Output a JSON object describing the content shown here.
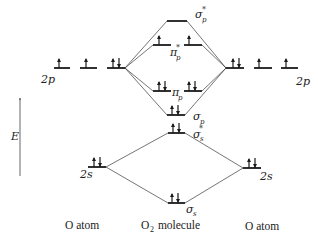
{
  "diagram": {
    "axis": {
      "label": "E"
    },
    "columns": {
      "left": "O atom",
      "center_main": "O",
      "center_sub": "2",
      "center_rest": " molecule",
      "right": "O atom"
    },
    "atomic_orbitals": {
      "left_2p": {
        "label": "2p",
        "electrons": [
          1,
          1,
          2
        ]
      },
      "right_2p": {
        "label": "2p",
        "electrons": [
          2,
          1,
          1
        ]
      },
      "left_2s": {
        "label": "2s",
        "electrons": 2
      },
      "right_2s": {
        "label": "2s",
        "electrons": 2
      }
    },
    "molecular_orbitals": [
      {
        "name": "σ",
        "sub": "p",
        "star": "*",
        "electrons": 0
      },
      {
        "name": "π",
        "sub": "p",
        "star": "*",
        "electrons": [
          1,
          1
        ]
      },
      {
        "name": "π",
        "sub": "p",
        "star": "",
        "electrons": [
          2,
          2
        ]
      },
      {
        "name": "σ",
        "sub": "p",
        "star": "",
        "electrons": 2
      },
      {
        "name": "σ",
        "sub": "s",
        "star": "*",
        "electrons": 2
      },
      {
        "name": "σ",
        "sub": "s",
        "star": "",
        "electrons": 2
      }
    ]
  }
}
